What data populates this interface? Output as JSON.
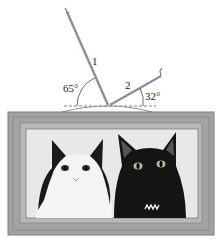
{
  "diagram": {
    "wire1": {
      "label": "1",
      "angle": "65°"
    },
    "wire2": {
      "label": "2",
      "angle": "32°"
    },
    "colors": {
      "frame_outer": "#9a9a9a",
      "frame_mat": "#b9b9b9",
      "wire": "#8a8a8a",
      "dashed_line": "#555555",
      "picture_bg": "#e8e8e8"
    },
    "picture": {
      "subject": "two cats, black-and-white and black"
    }
  }
}
